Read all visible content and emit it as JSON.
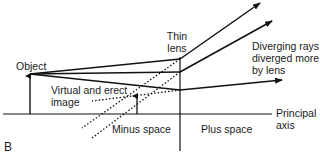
{
  "figure": {
    "panel_label": "B",
    "labels": {
      "object": "Object",
      "thin_lens_1": "Thin",
      "thin_lens_2": "lens",
      "diverging_1": "Diverging rays",
      "diverging_2": "diverged more",
      "diverging_3": "by lens",
      "virtual_1": "Virtual and erect",
      "virtual_2": "image",
      "minus_space": "Minus space",
      "plus_space": "Plus space",
      "principal_1": "Principal",
      "principal_2": "axis"
    },
    "colors": {
      "line": "#111111",
      "background": "#ffffff"
    }
  }
}
